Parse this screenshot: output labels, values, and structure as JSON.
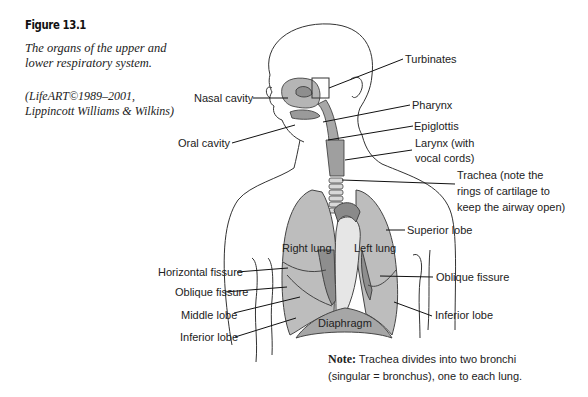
{
  "figure": {
    "number": "Figure 13.1",
    "caption": "The organs of the upper and lower respiratory system.",
    "credit_line1": "(LifeART©1989–2001,",
    "credit_line2": "Lippincott Williams & Wilkins)"
  },
  "labels": {
    "nasal_cavity": "Nasal cavity",
    "oral_cavity": "Oral cavity",
    "turbinates": "Turbinates",
    "pharynx": "Pharynx",
    "epiglottis": "Epiglottis",
    "larynx_line1": "Larynx (with",
    "larynx_line2": "vocal cords)",
    "trachea_line1": "Trachea (note the",
    "trachea_line2": "rings of cartilage to",
    "trachea_line3": "keep the airway open)",
    "superior_lobe": "Superior lobe",
    "right_lung": "Right lung",
    "left_lung": "Left lung",
    "horizontal_fissure": "Horizontal fissure",
    "oblique_fissure_left": "Oblique fissure",
    "oblique_fissure_right": "Oblique fissure",
    "middle_lobe": "Middle lobe",
    "inferior_lobe_left": "Inferior lobe",
    "inferior_lobe_right": "Inferior lobe",
    "diaphragm": "Diaphragm"
  },
  "note": {
    "prefix": "Note:",
    "line1": "Trachea divides into two bronchi",
    "line2": "(singular = bronchus), one to each lung."
  },
  "colors": {
    "lung_fill": "#b8b8b8",
    "lung_dark": "#8e8e8e",
    "airway_fill": "#a8a8a8",
    "line": "#222222"
  }
}
